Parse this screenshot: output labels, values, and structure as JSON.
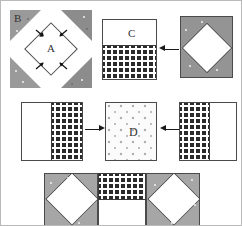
{
  "diagram": {
    "labels": {
      "a": "A",
      "b": "B",
      "c": "C",
      "d": "D"
    },
    "colors": {
      "fabric_gray": "#949494",
      "fabric_gray_light": "#a6a6a6",
      "fabric_white": "#ffffff",
      "fabric_checked_dark": "#2b2b2b",
      "fabric_speckled": "#fbfbfb",
      "outline": "#4a4a4a",
      "arrow": "#1a1a1a",
      "frame_border": "#b9b9b9"
    },
    "rows": [
      {
        "name": "row-1",
        "steps": [
          {
            "name": "diamond-with-corner-triangles",
            "center_label": "A",
            "corner_label": "B",
            "corner_count": 4,
            "arrow_directions": [
              "down-right",
              "down-left",
              "up-right",
              "up-left"
            ]
          },
          {
            "name": "square-c",
            "label": "C",
            "top_fabric": "white",
            "bottom_fabric": "checked"
          },
          {
            "name": "arrow-left-row1",
            "direction": "left"
          },
          {
            "name": "gray-square-with-white-diamond",
            "background_fabric": "gray",
            "center_fabric": "white"
          }
        ]
      },
      {
        "name": "row-2",
        "steps": [
          {
            "name": "square-white-check-left",
            "left_fabric": "white",
            "right_fabric": "checked"
          },
          {
            "name": "arrow-right-row2",
            "direction": "right"
          },
          {
            "name": "square-d",
            "label": "D",
            "fabric": "speckled"
          },
          {
            "name": "arrow-left-row2",
            "direction": "left"
          },
          {
            "name": "square-check-white-right",
            "left_fabric": "checked",
            "right_fabric": "white"
          }
        ]
      },
      {
        "name": "row-3",
        "steps": [
          {
            "name": "assembled-unit-left",
            "background_fabric": "gray",
            "center_fabric": "white"
          },
          {
            "name": "assembled-unit-center-top",
            "fabric": "checked"
          },
          {
            "name": "assembled-unit-center-bottom",
            "fabric": "white"
          },
          {
            "name": "assembled-unit-right",
            "background_fabric": "gray",
            "center_fabric": "white"
          }
        ]
      }
    ]
  }
}
